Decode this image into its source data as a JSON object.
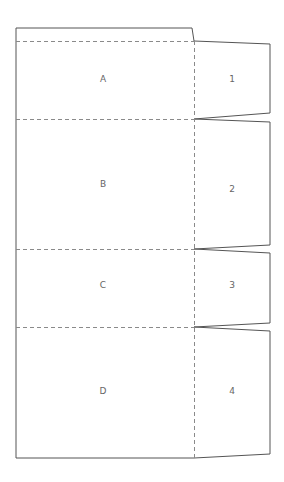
{
  "diagram": {
    "type": "box-net-template",
    "colors": {
      "cut_line": "#555555",
      "fold_line": "#8a8a8a",
      "label": "#666666",
      "background": "#ffffff"
    },
    "panels": [
      {
        "id": "A",
        "label": "A"
      },
      {
        "id": "B",
        "label": "B"
      },
      {
        "id": "C",
        "label": "C"
      },
      {
        "id": "D",
        "label": "D"
      }
    ],
    "tabs": [
      {
        "id": "1",
        "label": "1"
      },
      {
        "id": "2",
        "label": "2"
      },
      {
        "id": "3",
        "label": "3"
      },
      {
        "id": "4",
        "label": "4"
      }
    ]
  }
}
